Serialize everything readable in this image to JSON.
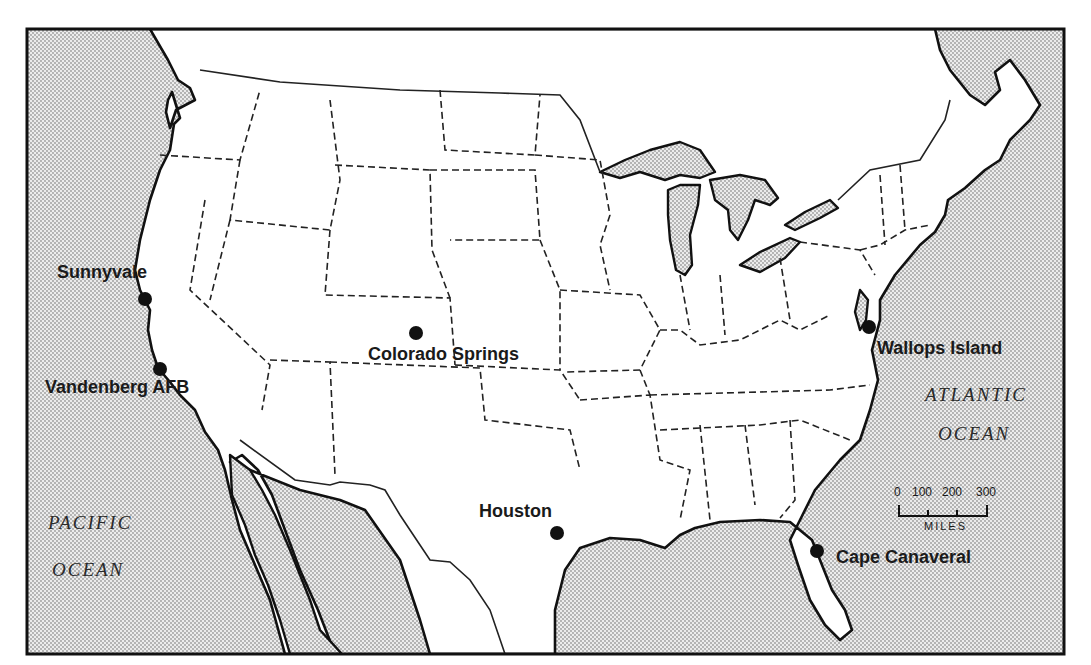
{
  "map": {
    "title": "",
    "frame": {
      "x": 27,
      "y": 29,
      "width": 1037,
      "height": 625
    },
    "colors": {
      "land": "#ffffff",
      "water_pattern": "#c8c8c8",
      "ink": "#111111"
    },
    "oceans": [
      {
        "id": "pacific",
        "line1": "PACIFIC",
        "line2": "OCEAN"
      },
      {
        "id": "atlantic",
        "line1": "ATLANTIC",
        "line2": "OCEAN"
      }
    ],
    "sites": [
      {
        "id": "sunnyvale",
        "label": "Sunnyvale",
        "x": 145,
        "y": 299
      },
      {
        "id": "vandenberg",
        "label": "Vandenberg AFB",
        "x": 160,
        "y": 369
      },
      {
        "id": "colorado-springs",
        "label": "Colorado Springs",
        "x": 416,
        "y": 333
      },
      {
        "id": "houston",
        "label": "Houston",
        "x": 557,
        "y": 533
      },
      {
        "id": "wallops-island",
        "label": "Wallops Island",
        "x": 869,
        "y": 327
      },
      {
        "id": "cape-canaveral",
        "label": "Cape Canaveral",
        "x": 817,
        "y": 551
      }
    ],
    "scale": {
      "ticks": [
        "0",
        "100",
        "200",
        "300"
      ],
      "unit": "MILES"
    }
  }
}
